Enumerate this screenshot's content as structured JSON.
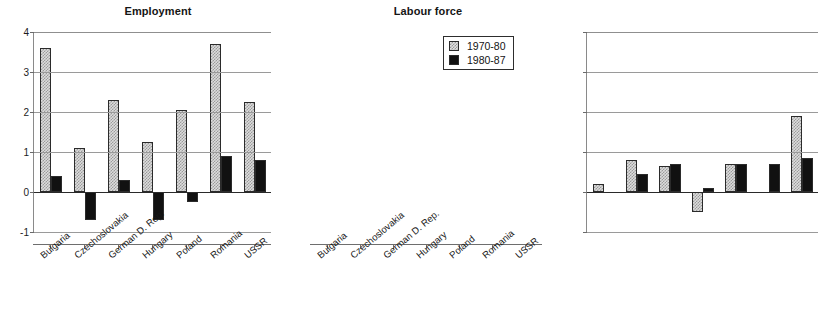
{
  "chart_data": [
    {
      "type": "bar",
      "title": "Employment",
      "xlabel": "",
      "ylabel": "",
      "ylim": [
        -1,
        4
      ],
      "yticks": [
        -1,
        0,
        1,
        2,
        3,
        4
      ],
      "ytick_labels": [
        "-1",
        "0",
        "1",
        "2",
        "3",
        "4"
      ],
      "grid": true,
      "categories": [
        "Bulgaria",
        "Czechoslovakia",
        "German D. Rep.",
        "Hungary",
        "Poland",
        "Romania",
        "USSR"
      ],
      "series": [
        {
          "name": "1970-80",
          "values": [
            3.6,
            1.1,
            2.3,
            1.25,
            2.05,
            3.7,
            2.25
          ]
        },
        {
          "name": "1980-87",
          "values": [
            0.4,
            -0.7,
            0.3,
            -0.7,
            -0.25,
            0.9,
            0.8
          ]
        }
      ],
      "legend": null
    },
    {
      "type": "bar",
      "title": "Labour force",
      "xlabel": "",
      "ylabel": "",
      "ylim": [
        -1,
        4
      ],
      "yticks": [
        -1,
        0,
        1,
        2,
        3,
        4
      ],
      "ytick_labels": [
        "",
        "",
        "",
        "",
        "",
        ""
      ],
      "grid": true,
      "categories": [
        "Bulgaria",
        "Czechoslovakia",
        "German D. Rep.",
        "Hungary",
        "Poland",
        "Romania",
        "USSR"
      ],
      "series": [
        {
          "name": "1970-80",
          "values": [
            0.2,
            0.8,
            0.65,
            -0.5,
            0.7,
            0.0,
            1.9
          ]
        },
        {
          "name": "1980-87",
          "values": [
            0.0,
            0.45,
            0.7,
            0.1,
            0.7,
            0.7,
            0.85
          ]
        }
      ],
      "legend": {
        "position": "top-right",
        "entries": [
          {
            "label": "1970-80",
            "swatch": "hatched-light"
          },
          {
            "label": "1980-87",
            "swatch": "solid-black"
          }
        ]
      }
    }
  ],
  "colors": {
    "series_1970_80": "#dcdcdc",
    "series_1980_87": "#111111",
    "axis": "#6e6e6e",
    "grid": "#9a9a9a",
    "text": "#171717",
    "background": "#ffffff"
  }
}
